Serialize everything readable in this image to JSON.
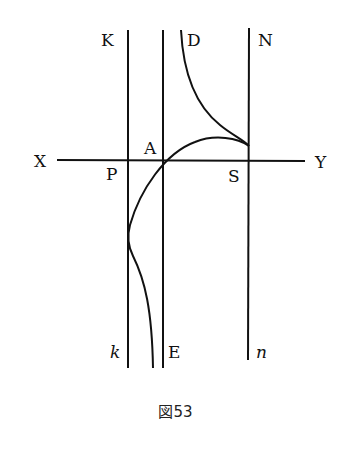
{
  "figure": {
    "caption": "図53",
    "labels": {
      "K": "K",
      "D": "D",
      "N": "N",
      "A": "A",
      "X": "X",
      "Y": "Y",
      "P": "P",
      "S": "S",
      "k": "k",
      "E": "E",
      "n": "n"
    },
    "elements": {
      "axis": "XY horizontal line",
      "vertical_lines": [
        "Kk",
        "AE",
        "Nn"
      ],
      "curves": [
        "upper branch D asymptotic to AE, cusp on Nn above axis",
        "lower branch from cusp crossing axis, touching Kk, asymptotic to AE downward"
      ]
    },
    "colors": {
      "ink": "#111111",
      "background": "#ffffff"
    }
  }
}
